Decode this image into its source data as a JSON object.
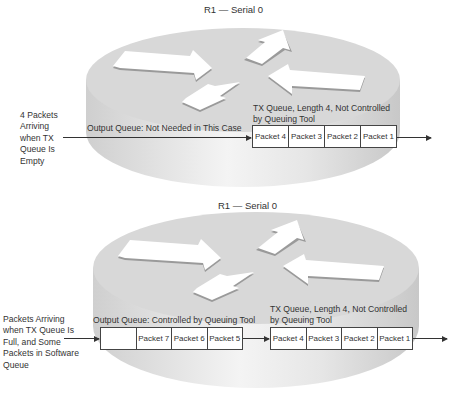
{
  "colors": {
    "disk_top": "#d6d6d6",
    "disk_side": "#e4e4e4",
    "arrow_fill": "#ffffff",
    "arrow_shadow": "#9a9a9a",
    "text": "#333333",
    "box_border": "#444444"
  },
  "panels": [
    {
      "title": "R1 — Serial 0",
      "input_label": [
        "4 Packets",
        "Arriving",
        "when TX",
        "Queue Is",
        "Empty"
      ],
      "output_queue": {
        "label": "Output Queue: Not Needed in This Case",
        "cells": []
      },
      "tx_queue": {
        "label_line1": "TX Queue, Length 4, Not Controlled",
        "label_line2": "by Queuing Tool",
        "cells": [
          "Packet 4",
          "Packet 3",
          "Packet 2",
          "Packet 1"
        ]
      }
    },
    {
      "title": "R1 — Serial 0",
      "input_label": [
        "Packets Arriving",
        "when TX Queue Is",
        "Full, and Some",
        "Packets in Software",
        "Queue"
      ],
      "output_queue": {
        "label": "Output Queue: Controlled by Queuing Tool",
        "cells": [
          "",
          "Packet 7",
          "Packet 6",
          "Packet 5"
        ]
      },
      "tx_queue": {
        "label_line1": "TX Queue, Length 4, Not Controlled",
        "label_line2": "by Queuing Tool",
        "cells": [
          "Packet 4",
          "Packet 3",
          "Packet 2",
          "Packet 1"
        ]
      }
    }
  ],
  "icons": {
    "router": "router-icon",
    "flow_arrow": "arrow-right-icon"
  }
}
